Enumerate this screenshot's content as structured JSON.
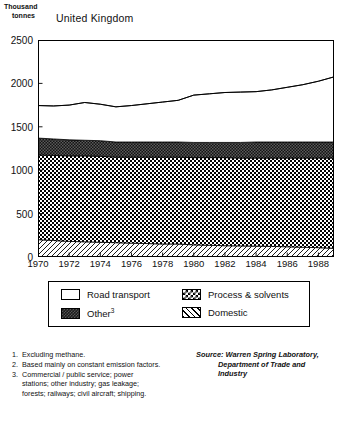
{
  "axis_unit": {
    "line1": "Thousand",
    "line2": "tonnes"
  },
  "chart_title": "United Kingdom",
  "legend": {
    "items": [
      {
        "label": "Road transport",
        "pattern": "white",
        "footnote": ""
      },
      {
        "label": "Other",
        "pattern": "other",
        "footnote": "3"
      },
      {
        "label": "Process & solvents",
        "pattern": "process",
        "footnote": ""
      },
      {
        "label": "Domestic",
        "pattern": "domestic",
        "footnote": ""
      }
    ]
  },
  "footnotes": [
    {
      "num": "1.",
      "text": "Excluding methane."
    },
    {
      "num": "2.",
      "text": "Based mainly on constant emission factors."
    },
    {
      "num": "3.",
      "text": "Commercial / public service; power stations; other industry; gas leakage; forests; railways; civil aircraft; shipping."
    }
  ],
  "source": {
    "label": "Source:",
    "line1": "Warren Spring Laboratory,",
    "line2": "Department of Trade and",
    "line3": "Industry"
  },
  "chart_data": {
    "type": "area",
    "stacked": true,
    "title": "United Kingdom",
    "xlabel": "",
    "ylabel": "Thousand tonnes",
    "ylim": [
      0,
      2500
    ],
    "yticks": [
      0,
      500,
      1000,
      1500,
      2000,
      2500
    ],
    "xlim": [
      1970,
      1989
    ],
    "xticks": [
      1970,
      1972,
      1974,
      1976,
      1978,
      1980,
      1982,
      1984,
      1986,
      1988
    ],
    "grid": false,
    "legend_position": "below-plot",
    "x": [
      1970,
      1971,
      1972,
      1973,
      1974,
      1975,
      1976,
      1977,
      1978,
      1979,
      1980,
      1981,
      1982,
      1983,
      1984,
      1985,
      1986,
      1987,
      1988,
      1989
    ],
    "series": [
      {
        "name": "Domestic",
        "pattern": "domestic",
        "values": [
          200,
          190,
          180,
          175,
          170,
          165,
          160,
          155,
          150,
          150,
          140,
          135,
          130,
          128,
          125,
          122,
          118,
          112,
          108,
          100
        ]
      },
      {
        "name": "Process & solvents",
        "pattern": "process",
        "values": [
          975,
          980,
          985,
          990,
          990,
          985,
          990,
          995,
          1000,
          1000,
          1005,
          1010,
          1015,
          1012,
          1015,
          1018,
          1022,
          1028,
          1032,
          1040
        ]
      },
      {
        "name": "Other",
        "pattern": "other",
        "values": [
          195,
          190,
          185,
          180,
          180,
          175,
          175,
          175,
          175,
          175,
          175,
          175,
          175,
          180,
          185,
          185,
          185,
          185,
          185,
          185
        ]
      },
      {
        "name": "Road transport",
        "pattern": "white",
        "values": [
          375,
          380,
          400,
          435,
          420,
          405,
          420,
          440,
          460,
          480,
          545,
          560,
          575,
          580,
          580,
          600,
          630,
          660,
          700,
          750
        ]
      }
    ],
    "totals": [
      1745,
      1740,
      1750,
      1780,
      1760,
      1730,
      1745,
      1765,
      1785,
      1805,
      1865,
      1880,
      1895,
      1900,
      1905,
      1925,
      1955,
      1985,
      2025,
      2075
    ]
  }
}
